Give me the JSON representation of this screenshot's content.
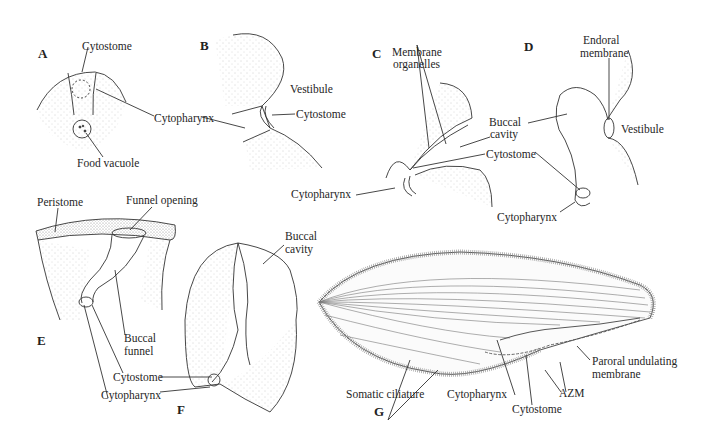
{
  "figure": {
    "stroke_color": "#333333",
    "stipple_color": "#9a9a9a"
  },
  "panels": {
    "A": {
      "letter": "A",
      "labels": {
        "cytostome": "Cytostome",
        "cytopharynx": "Cytopharynx",
        "food_vacuole": "Food vacuole"
      }
    },
    "B": {
      "letter": "B",
      "labels": {
        "vestibule": "Vestibule",
        "cytostome": "Cytostome"
      }
    },
    "C": {
      "letter": "C",
      "labels": {
        "membrane_organelles_1": "Membrane",
        "membrane_organelles_2": "organelles",
        "buccal_cavity_1": "Buccal",
        "buccal_cavity_2": "cavity",
        "cytostome": "Cytostome",
        "cytopharynx": "Cytopharynx"
      }
    },
    "D": {
      "letter": "D",
      "labels": {
        "endoral_membrane_1": "Endoral",
        "endoral_membrane_2": "membrane",
        "vestibule": "Vestibule",
        "cytopharynx": "Cytopharynx"
      }
    },
    "E": {
      "letter": "E",
      "labels": {
        "peristome": "Peristome",
        "funnel_opening": "Funnel opening",
        "buccal_funnel_1": "Buccal",
        "buccal_funnel_2": "funnel",
        "cytostome": "Cytostome",
        "cytopharynx": "Cytopharynx"
      }
    },
    "F": {
      "letter": "F",
      "labels": {
        "buccal_cavity_1": "Buccal",
        "buccal_cavity_2": "cavity"
      }
    },
    "G": {
      "letter": "G",
      "labels": {
        "somatic_ciliature": "Somatic ciliature",
        "cytopharynx": "Cytopharynx",
        "cytostome": "Cytostome",
        "azm": "AZM",
        "paroral_1": "Paroral undulating",
        "paroral_2": "membrane"
      }
    }
  }
}
